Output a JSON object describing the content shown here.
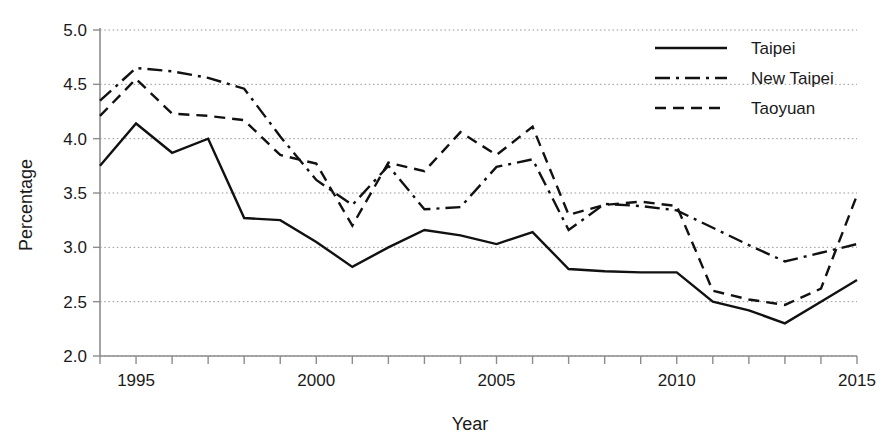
{
  "chart_data": {
    "type": "line",
    "title": "",
    "xlabel": "Year",
    "ylabel": "Percentage",
    "xlim": [
      1994,
      2015
    ],
    "ylim": [
      2.0,
      5.0
    ],
    "grid": true,
    "legend_position": "top-right",
    "x": [
      1994,
      1995,
      1996,
      1997,
      1998,
      1999,
      2000,
      2001,
      2002,
      2003,
      2004,
      2005,
      2006,
      2007,
      2008,
      2009,
      2010,
      2011,
      2012,
      2013,
      2014,
      2015
    ],
    "x_tick_labels": [
      "1995",
      "2000",
      "2005",
      "2010",
      "2015"
    ],
    "x_tick_values": [
      1995,
      2000,
      2005,
      2010,
      2015
    ],
    "y_tick_labels": [
      "2.0",
      "2.5",
      "3.0",
      "3.5",
      "4.0",
      "4.5",
      "5.0"
    ],
    "y_tick_values": [
      2.0,
      2.5,
      3.0,
      3.5,
      4.0,
      4.5,
      5.0
    ],
    "series": [
      {
        "name": "Taipei",
        "style": "solid",
        "values": [
          3.75,
          4.14,
          3.87,
          4.0,
          3.27,
          3.25,
          3.05,
          2.82,
          3.0,
          3.16,
          3.11,
          3.03,
          3.14,
          2.8,
          2.78,
          2.77,
          2.77,
          2.5,
          2.42,
          2.3,
          2.5,
          2.7
        ]
      },
      {
        "name": "New Taipei",
        "style": "dash-dot",
        "values": [
          4.35,
          4.65,
          4.62,
          4.56,
          4.46,
          4.02,
          3.62,
          3.39,
          3.75,
          3.35,
          3.37,
          3.74,
          3.81,
          3.16,
          3.4,
          3.38,
          3.34,
          3.18,
          3.02,
          2.87,
          2.95,
          3.03
        ]
      },
      {
        "name": "Taoyuan",
        "style": "dashed",
        "values": [
          4.21,
          4.55,
          4.23,
          4.21,
          4.17,
          3.85,
          3.77,
          3.2,
          3.78,
          3.7,
          4.06,
          3.85,
          4.11,
          3.3,
          3.39,
          3.42,
          3.38,
          2.6,
          2.52,
          2.47,
          2.62,
          3.48
        ]
      }
    ]
  },
  "legend": {
    "entries": [
      {
        "label": "Taipei",
        "style": "solid"
      },
      {
        "label": "New Taipei",
        "style": "dash-dot"
      },
      {
        "label": "Taoyuan",
        "style": "dashed"
      }
    ]
  },
  "axes": {
    "y_axis_title": "Percentage",
    "x_axis_title": "Year"
  },
  "colors": {
    "line": "#111111",
    "grid": "#9a9a9a",
    "axis": "#8d8d8d",
    "background": "#ffffff"
  }
}
